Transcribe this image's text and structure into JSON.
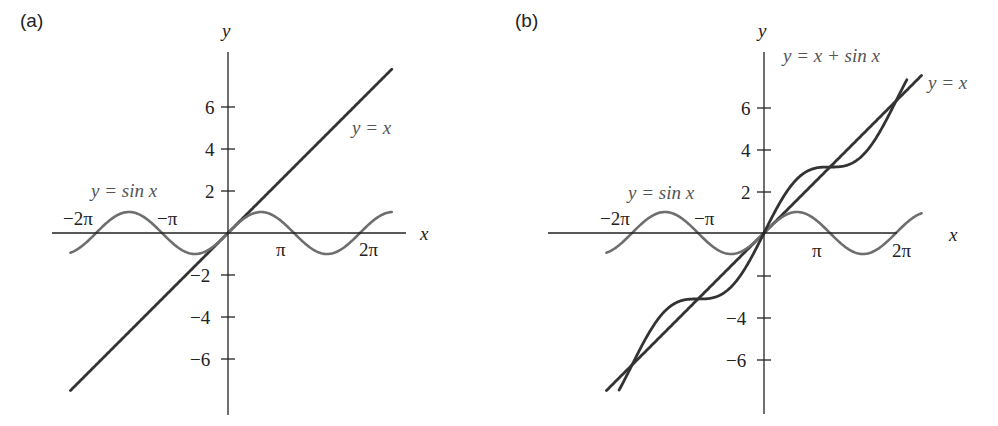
{
  "chart_data": [
    {
      "type": "line",
      "panel_label": "(a)",
      "xlabel": "x",
      "ylabel": "y",
      "xlim": [
        -7.5,
        7.8
      ],
      "ylim": [
        -7.8,
        8.5
      ],
      "grid": false,
      "y_ticks": [
        6,
        4,
        2,
        -2,
        -4,
        -6
      ],
      "y_tick_labels": [
        "6",
        "4",
        "2",
        "−2",
        "−4",
        "−6"
      ],
      "x_ticks": [
        -6.2832,
        -3.1416,
        3.1416,
        6.2832
      ],
      "x_tick_labels": [
        "−2π",
        "−π",
        "π",
        "2π"
      ],
      "series": [
        {
          "name": "y = x",
          "function": "x",
          "x_range": [
            -7.5,
            7.8
          ]
        },
        {
          "name": "y = sin x",
          "function": "sin(x)",
          "x_range": [
            -7.5,
            7.8
          ]
        }
      ],
      "annotations": [
        "y = x",
        "y = sin x"
      ]
    },
    {
      "type": "line",
      "panel_label": "(b)",
      "xlabel": "x",
      "ylabel": "y",
      "xlim": [
        -7.5,
        7.8
      ],
      "ylim": [
        -7.8,
        8.5
      ],
      "grid": false,
      "y_ticks": [
        6,
        4,
        2,
        -2,
        -4,
        -6
      ],
      "y_tick_labels": [
        "6",
        "4",
        "2",
        "",
        "−4",
        "−6"
      ],
      "x_ticks": [
        -6.2832,
        -3.1416,
        3.1416,
        6.2832
      ],
      "x_tick_labels": [
        "−2π",
        "−π",
        "π",
        "2π"
      ],
      "series": [
        {
          "name": "y = x",
          "function": "x",
          "x_range": [
            -7.5,
            7.5
          ]
        },
        {
          "name": "y = sin x",
          "function": "sin(x)",
          "x_range": [
            -7.5,
            7.5
          ]
        },
        {
          "name": "y = x + sin x",
          "function": "x + sin(x)",
          "x_range": [
            -6.9,
            6.8
          ]
        }
      ],
      "annotations": [
        "y = x + sin x",
        "y = x",
        "y = sin x"
      ]
    }
  ],
  "panels": {
    "a": {
      "label": "(a)",
      "axis_x": "x",
      "axis_y": "y",
      "y_ticks": [
        "6",
        "4",
        "2",
        "−2",
        "−4",
        "−6"
      ],
      "x_ticks": [
        "−2π",
        "−π",
        "π",
        "2π"
      ],
      "line_label": "y = x",
      "sine_label": "y = sin x"
    },
    "b": {
      "label": "(b)",
      "axis_x": "x",
      "axis_y": "y",
      "y_ticks": [
        "6",
        "4",
        "2",
        "−4",
        "−6"
      ],
      "x_ticks": [
        "−2π",
        "−π",
        "π",
        "2π"
      ],
      "sum_label": "y = x + sin x",
      "line_label": "y = x",
      "sine_label": "y = sin x"
    }
  },
  "colors": {
    "line": "#333333",
    "sine": "#6e6e6e",
    "axis": "#222222",
    "label_light": "#666666"
  }
}
